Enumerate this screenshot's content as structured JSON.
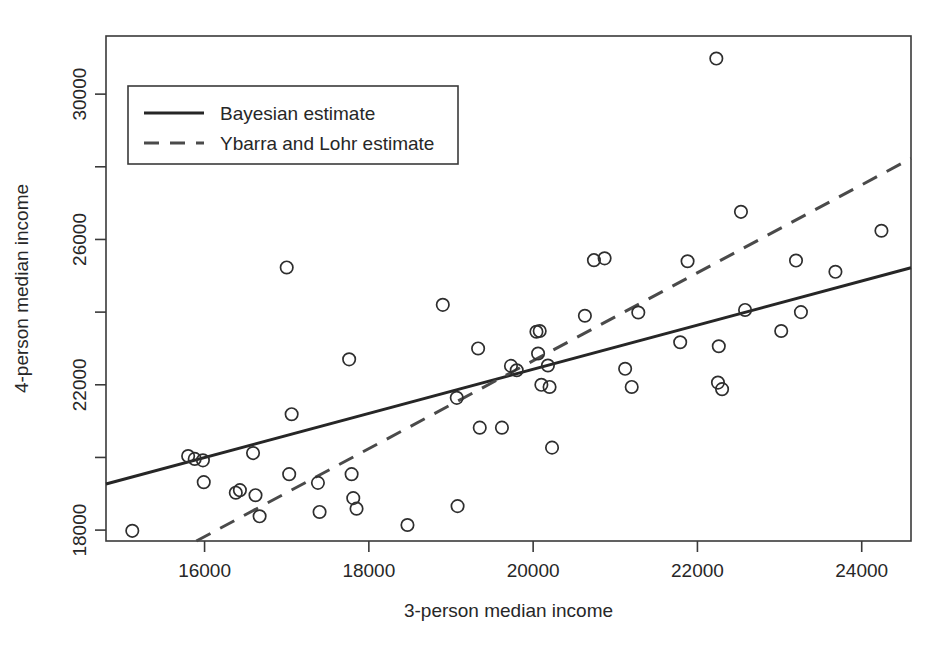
{
  "chart_data": {
    "type": "scatter",
    "title": "",
    "xlabel": "3-person median income",
    "ylabel": "4-person median income",
    "xlim": [
      14800,
      24600
    ],
    "ylim": [
      17700,
      31600
    ],
    "grid": false,
    "xticks": [
      16000,
      18000,
      20000,
      22000,
      24000
    ],
    "xticklabels": [
      "16000",
      "18000",
      "20000",
      "22000",
      "24000"
    ],
    "yticks": [
      18000,
      20000,
      22000,
      24000,
      26000,
      28000,
      30000
    ],
    "yticklabels": [
      "18000",
      "",
      "22000",
      "",
      "26000",
      "",
      "30000"
    ],
    "legend": {
      "position": "top-left",
      "entries": [
        {
          "label": "Bayesian estimate",
          "style": "solid"
        },
        {
          "label": "Ybarra and Lohr estimate",
          "style": "dashed"
        }
      ]
    },
    "points": [
      {
        "x": 15120,
        "y": 17980
      },
      {
        "x": 15800,
        "y": 20040
      },
      {
        "x": 15880,
        "y": 19960
      },
      {
        "x": 15980,
        "y": 19920
      },
      {
        "x": 15990,
        "y": 19320
      },
      {
        "x": 16380,
        "y": 19030
      },
      {
        "x": 16430,
        "y": 19100
      },
      {
        "x": 16590,
        "y": 20120
      },
      {
        "x": 16620,
        "y": 18960
      },
      {
        "x": 16670,
        "y": 18380
      },
      {
        "x": 17000,
        "y": 25230
      },
      {
        "x": 17030,
        "y": 19540
      },
      {
        "x": 17060,
        "y": 21190
      },
      {
        "x": 17380,
        "y": 19300
      },
      {
        "x": 17400,
        "y": 18500
      },
      {
        "x": 17760,
        "y": 22700
      },
      {
        "x": 17790,
        "y": 19540
      },
      {
        "x": 17810,
        "y": 18880
      },
      {
        "x": 17850,
        "y": 18590
      },
      {
        "x": 18470,
        "y": 18140
      },
      {
        "x": 18900,
        "y": 24200
      },
      {
        "x": 19070,
        "y": 21640
      },
      {
        "x": 19080,
        "y": 18660
      },
      {
        "x": 19330,
        "y": 23000
      },
      {
        "x": 19350,
        "y": 20820
      },
      {
        "x": 19620,
        "y": 20820
      },
      {
        "x": 19730,
        "y": 22520
      },
      {
        "x": 19800,
        "y": 22400
      },
      {
        "x": 20040,
        "y": 23460
      },
      {
        "x": 20060,
        "y": 22860
      },
      {
        "x": 20080,
        "y": 23480
      },
      {
        "x": 20100,
        "y": 22000
      },
      {
        "x": 20180,
        "y": 22530
      },
      {
        "x": 20200,
        "y": 21940
      },
      {
        "x": 20230,
        "y": 20270
      },
      {
        "x": 20630,
        "y": 23900
      },
      {
        "x": 20740,
        "y": 25430
      },
      {
        "x": 20870,
        "y": 25480
      },
      {
        "x": 21120,
        "y": 22440
      },
      {
        "x": 21200,
        "y": 21940
      },
      {
        "x": 21280,
        "y": 23990
      },
      {
        "x": 21790,
        "y": 23170
      },
      {
        "x": 21880,
        "y": 25400
      },
      {
        "x": 22230,
        "y": 30980
      },
      {
        "x": 22250,
        "y": 22060
      },
      {
        "x": 22260,
        "y": 23060
      },
      {
        "x": 22300,
        "y": 21880
      },
      {
        "x": 22530,
        "y": 26760
      },
      {
        "x": 22580,
        "y": 24060
      },
      {
        "x": 23020,
        "y": 23480
      },
      {
        "x": 23200,
        "y": 25420
      },
      {
        "x": 23260,
        "y": 24000
      },
      {
        "x": 23680,
        "y": 25110
      },
      {
        "x": 24240,
        "y": 26240
      }
    ],
    "lines": [
      {
        "name": "Bayesian estimate",
        "style": "solid",
        "x": [
          14800,
          24600
        ],
        "y": [
          19270,
          25220
        ]
      },
      {
        "name": "Ybarra and Lohr estimate",
        "style": "dashed",
        "x": [
          15900,
          24600
        ],
        "y": [
          17700,
          28230
        ]
      }
    ]
  }
}
